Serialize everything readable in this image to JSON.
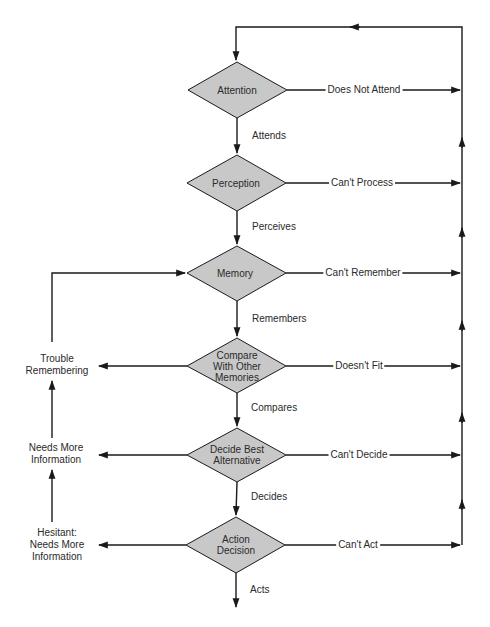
{
  "colors": {
    "diamond_fill": "#c8c8c8",
    "stroke": "#1a1a1a",
    "text": "#2a2a2a"
  },
  "nodes": [
    {
      "id": "attention",
      "lines": [
        "Attention"
      ],
      "cx": 237,
      "cy": 90
    },
    {
      "id": "perception",
      "lines": [
        "Perception"
      ],
      "cx": 237,
      "cy": 183
    },
    {
      "id": "memory",
      "lines": [
        "Memory"
      ],
      "cx": 237,
      "cy": 273
    },
    {
      "id": "compare",
      "lines": [
        "Compare",
        "With Other",
        "Memories"
      ],
      "cx": 237,
      "cy": 366
    },
    {
      "id": "decide",
      "lines": [
        "Decide Best",
        "Alternative"
      ],
      "cx": 237,
      "cy": 455
    },
    {
      "id": "action",
      "lines": [
        "Action",
        "Decision"
      ],
      "cx": 236,
      "cy": 545
    }
  ],
  "down_edges": [
    {
      "label": "Attends"
    },
    {
      "label": "Perceives"
    },
    {
      "label": "Remembers"
    },
    {
      "label": "Compares"
    },
    {
      "label": "Decides"
    },
    {
      "label": "Acts"
    }
  ],
  "right_edges": [
    {
      "label": "Does Not Attend"
    },
    {
      "label": "Can't Process"
    },
    {
      "label": "Can't Remember"
    },
    {
      "label": "Doesn't Fit"
    },
    {
      "label": "Can't Decide"
    },
    {
      "label": "Can't Act"
    }
  ],
  "left_labels": [
    {
      "lines": [
        "Trouble",
        "Remembering"
      ]
    },
    {
      "lines": [
        "Needs More",
        "Information"
      ]
    },
    {
      "lines": [
        "Hesitant:",
        "Needs More",
        "Information"
      ]
    }
  ]
}
